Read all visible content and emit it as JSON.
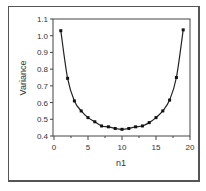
{
  "chart_data": {
    "type": "line",
    "title": "",
    "xlabel": "n1",
    "ylabel": "Variance",
    "xlim": [
      0,
      20
    ],
    "ylim": [
      0.4,
      1.1
    ],
    "xticks": [
      0,
      5,
      10,
      15,
      20
    ],
    "xtick_labels": [
      "0",
      "5",
      "10",
      "15",
      "20"
    ],
    "yticks": [
      0.4,
      0.5,
      0.6,
      0.7,
      0.8,
      0.9,
      1.0,
      1.1
    ],
    "ytick_labels": [
      "0.4",
      "0.5",
      "0.6",
      "0.7",
      "0.8",
      "0.9",
      "1.0",
      "1.1"
    ],
    "grid": false,
    "legend": null,
    "series": [
      {
        "name": "Variance",
        "marker": "square",
        "line": "smooth",
        "x": [
          1,
          2,
          3,
          4,
          5,
          6,
          7,
          8,
          9,
          10,
          11,
          12,
          13,
          14,
          15,
          16,
          17,
          18,
          19
        ],
        "values": [
          1.03,
          0.745,
          0.61,
          0.55,
          0.51,
          0.485,
          0.46,
          0.455,
          0.445,
          0.44,
          0.445,
          0.455,
          0.46,
          0.48,
          0.51,
          0.55,
          0.615,
          0.75,
          1.035
        ]
      }
    ]
  }
}
